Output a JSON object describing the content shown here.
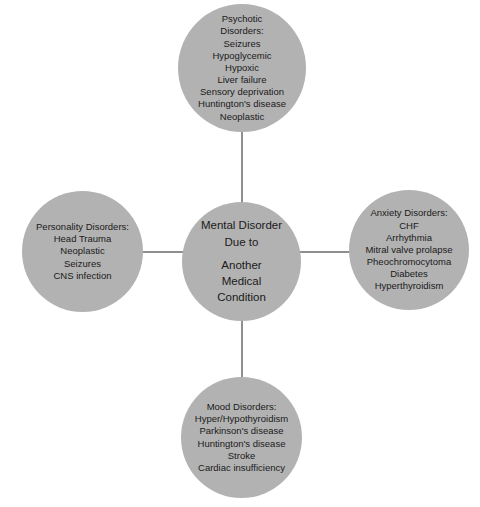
{
  "diagram": {
    "colors": {
      "node_fill": "#b2b2b2",
      "connector": "#8f8f8f",
      "text": "#1a1a1a",
      "background": "#ffffff"
    },
    "center": {
      "line1": "Mental Disorder",
      "line2": "Due to",
      "line3": "Another",
      "line4": "Medical",
      "line5": "Condition",
      "text": "Mental Disorder\nDue to"
    },
    "nodes": {
      "top": {
        "heading_line1": "Psychotic",
        "heading_line2": "Disorders:",
        "text": "Psychotic\nDisorders:\nSeizures\nHypoglycemic\nHypoxic\nLiver failure\nSensory deprivation\nHuntington's disease\nNeoplastic",
        "items": [
          "Seizures",
          "Hypoglycemic",
          "Hypoxic",
          "Liver failure",
          "Sensory deprivation",
          "Huntington's disease",
          "Neoplastic"
        ]
      },
      "left": {
        "heading": "Personality Disorders:",
        "text": "Personality Disorders:\nHead Trauma\nNeoplastic\nSeizures\nCNS infection",
        "items": [
          "Head Trauma",
          "Neoplastic",
          "Seizures",
          "CNS infection"
        ]
      },
      "right": {
        "heading": "Anxiety Disorders:",
        "text": "Anxiety Disorders:\nCHF\nArrhythmia\nMitral valve prolapse\nPheochromocytoma\nDiabetes\nHyperthyroidism",
        "items": [
          "CHF",
          "Arrhythmia",
          "Mitral valve prolapse",
          "Pheochromocytoma",
          "Diabetes",
          "Hyperthyroidism"
        ]
      },
      "bottom": {
        "heading": "Mood Disorders:",
        "text": "Mood Disorders:\nHyper/Hypothyroidism\nParkinson's disease\nHuntington's disease\nStroke\nCardiac insufficiency",
        "items": [
          "Hyper/Hypothyroidism",
          "Parkinson's disease",
          "Huntington's disease",
          "Stroke",
          "Cardiac insufficiency"
        ]
      }
    }
  }
}
